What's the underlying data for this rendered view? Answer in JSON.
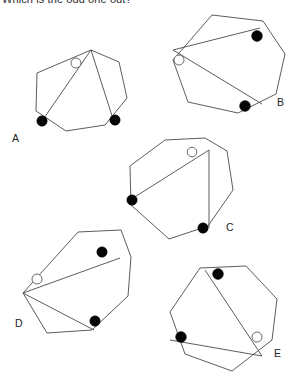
{
  "question": {
    "prompt": "Which is the odd one out?"
  },
  "style": {
    "background_color": "#ffffff",
    "stroke_color": "#4a4a4a",
    "filled_dot_color": "#050505",
    "open_dot_fill": "#ffffff",
    "open_dot_stroke": "#5a5a5a",
    "label_color": "#242424"
  },
  "figures": [
    {
      "label": "A",
      "label_x": 12,
      "label_y": 142,
      "polygon": "91,50 119,62 127,98 105,125 66,131 36,111 37,73",
      "chords": "M 91,50 L 42,121 M 91,50 L 113,119",
      "dots": [
        {
          "type": "open",
          "cx": 76,
          "cy": 63,
          "r": 5.0
        },
        {
          "type": "filled",
          "cx": 42,
          "cy": 121,
          "r": 5.2
        },
        {
          "type": "filled",
          "cx": 115,
          "cy": 120,
          "r": 5.2
        }
      ]
    },
    {
      "label": "B",
      "label_x": 277,
      "label_y": 106,
      "polygon": "212,15 263,21 285,54 276,94 238,113 188,102 173,60",
      "chords": "M 173,50 L 260,28 M 173,50 L 262,104",
      "dots": [
        {
          "type": "open",
          "cx": 179,
          "cy": 60,
          "r": 5.0
        },
        {
          "type": "filled",
          "cx": 257,
          "cy": 36,
          "r": 5.4
        },
        {
          "type": "filled",
          "cx": 245,
          "cy": 106,
          "r": 5.4
        }
      ]
    },
    {
      "label": "C",
      "label_x": 226,
      "label_y": 231,
      "polygon": "165,140 205,138 227,151 233,190 208,226 169,239 131,205 130,166"
    },
    {
      "label": "D",
      "label_x": 15,
      "label_y": 327,
      "polygon": "78,232 121,230 131,257 128,296 92,330 47,333 23,293"
    },
    {
      "label": "E",
      "label_x": 274,
      "label_y": 357,
      "polygon": "200,268 246,266 277,299 272,340 232,371 185,354 170,312"
    }
  ],
  "figures_extra": {
    "C": {
      "chords": "M 209,150 L 130,200 M 209,150 L 209,228",
      "dots": [
        {
          "type": "open",
          "cx": 192,
          "cy": 152,
          "r": 4.8
        },
        {
          "type": "filled",
          "cx": 132,
          "cy": 200,
          "r": 5.2
        },
        {
          "type": "filled",
          "cx": 203,
          "cy": 228,
          "r": 5.2
        }
      ]
    },
    "D": {
      "chords": "M 23,293 L 120,258 M 23,293 L 94,330",
      "dots": [
        {
          "type": "open",
          "cx": 37,
          "cy": 279,
          "r": 5.0
        },
        {
          "type": "filled",
          "cx": 102,
          "cy": 252,
          "r": 5.2
        },
        {
          "type": "filled",
          "cx": 95,
          "cy": 321,
          "r": 5.2
        }
      ]
    },
    "E": {
      "chords": "M 205,270 L 262,356 M 170,340 L 262,356",
      "dots": [
        {
          "type": "filled",
          "cx": 218,
          "cy": 274,
          "r": 5.4
        },
        {
          "type": "filled",
          "cx": 181,
          "cy": 337,
          "r": 5.4
        },
        {
          "type": "open",
          "cx": 257,
          "cy": 337,
          "r": 5.0
        }
      ]
    }
  }
}
